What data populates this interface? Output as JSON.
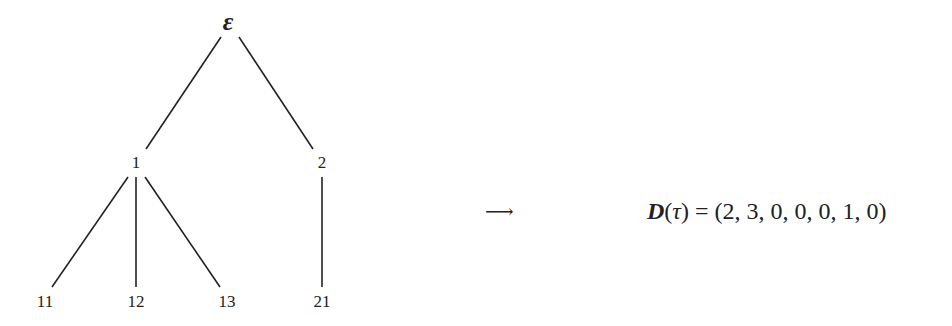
{
  "tree": {
    "root": {
      "id": "eps",
      "label": "ε",
      "x": 228,
      "y": 22
    },
    "nodes": [
      {
        "id": "n1",
        "label": "1",
        "x": 136,
        "y": 163
      },
      {
        "id": "n2",
        "label": "2",
        "x": 322,
        "y": 163
      },
      {
        "id": "n11",
        "label": "11",
        "x": 45,
        "y": 302
      },
      {
        "id": "n12",
        "label": "12",
        "x": 136,
        "y": 302
      },
      {
        "id": "n13",
        "label": "13",
        "x": 227,
        "y": 302
      },
      {
        "id": "n21",
        "label": "21",
        "x": 322,
        "y": 302
      }
    ],
    "edges": [
      {
        "from": "eps",
        "to": "n1",
        "x1": 221,
        "y1": 37,
        "x2": 146,
        "y2": 149
      },
      {
        "from": "eps",
        "to": "n2",
        "x1": 239,
        "y1": 37,
        "x2": 313,
        "y2": 149
      },
      {
        "from": "n1",
        "to": "n11",
        "x1": 128,
        "y1": 177,
        "x2": 52,
        "y2": 287
      },
      {
        "from": "n1",
        "to": "n12",
        "x1": 136,
        "y1": 177,
        "x2": 136,
        "y2": 287
      },
      {
        "from": "n1",
        "to": "n13",
        "x1": 145,
        "y1": 177,
        "x2": 220,
        "y2": 287
      },
      {
        "from": "n2",
        "to": "n21",
        "x1": 322,
        "y1": 177,
        "x2": 322,
        "y2": 287
      }
    ]
  },
  "arrow": "⟶",
  "formula": {
    "function": "D",
    "open_paren": "(",
    "argument": "τ",
    "close_paren": ")",
    "equals": " = ",
    "value": "(2, 3, 0, 0, 0, 1, 0)"
  }
}
